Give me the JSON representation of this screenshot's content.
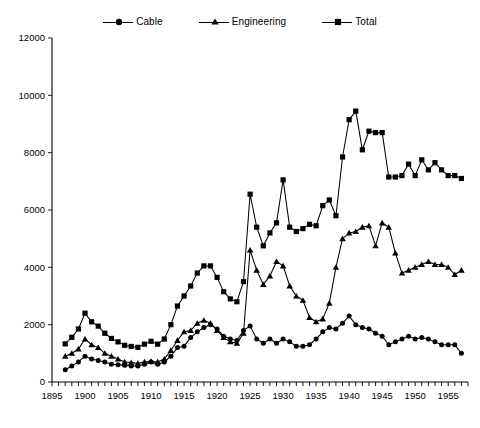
{
  "chart_data": {
    "type": "line",
    "title": "",
    "subtitle": "",
    "xlabel": "",
    "ylabel": "",
    "xlim": [
      1895,
      1958
    ],
    "ylim": [
      0,
      12000
    ],
    "ytick_step": 2000,
    "yticks": [
      0,
      2000,
      4000,
      6000,
      8000,
      10000,
      12000
    ],
    "xticks_labeled": [
      1895,
      1900,
      1905,
      1910,
      1915,
      1920,
      1925,
      1930,
      1935,
      1940,
      1945,
      1950,
      1955
    ],
    "xtick_minor_step": 1,
    "grid": false,
    "legend_position": "top-center",
    "x": [
      1897,
      1898,
      1899,
      1900,
      1901,
      1902,
      1903,
      1904,
      1905,
      1906,
      1907,
      1908,
      1909,
      1910,
      1911,
      1912,
      1913,
      1914,
      1915,
      1916,
      1917,
      1918,
      1919,
      1920,
      1921,
      1922,
      1923,
      1924,
      1925,
      1926,
      1927,
      1928,
      1929,
      1930,
      1931,
      1932,
      1933,
      1934,
      1935,
      1936,
      1937,
      1938,
      1939,
      1940,
      1941,
      1942,
      1943,
      1944,
      1945,
      1946,
      1947,
      1948,
      1949,
      1950,
      1951,
      1952,
      1953,
      1954,
      1955,
      1956,
      1957
    ],
    "series": [
      {
        "name": "Cable",
        "marker": "circle",
        "color": "#000000",
        "values": [
          430,
          560,
          700,
          900,
          800,
          750,
          700,
          620,
          600,
          580,
          560,
          560,
          620,
          700,
          620,
          700,
          900,
          1200,
          1250,
          1550,
          1750,
          1900,
          2000,
          1850,
          1600,
          1500,
          1450,
          1800,
          1950,
          1500,
          1350,
          1500,
          1350,
          1500,
          1400,
          1250,
          1250,
          1300,
          1500,
          1750,
          1900,
          1850,
          2050,
          2300,
          2000,
          1900,
          1850,
          1700,
          1600,
          1300,
          1400,
          1500,
          1600,
          1500,
          1550,
          1500,
          1400,
          1300,
          1300,
          1300,
          1000
        ]
      },
      {
        "name": "Engineering",
        "marker": "triangle",
        "color": "#000000",
        "values": [
          900,
          1000,
          1150,
          1500,
          1300,
          1200,
          1000,
          900,
          800,
          700,
          680,
          650,
          700,
          720,
          700,
          800,
          1100,
          1450,
          1750,
          1800,
          2050,
          2150,
          2050,
          1800,
          1550,
          1400,
          1350,
          1700,
          4600,
          3900,
          3400,
          3700,
          4200,
          4050,
          3350,
          3000,
          2850,
          2250,
          2100,
          2200,
          2750,
          4000,
          5000,
          5200,
          5250,
          5400,
          5450,
          4750,
          5550,
          5400,
          4500,
          3800,
          3900,
          4000,
          4100,
          4200,
          4100,
          4100,
          4000,
          3750,
          3900
        ]
      },
      {
        "name": "Total",
        "marker": "square",
        "color": "#000000",
        "values": [
          1330,
          1560,
          1850,
          2400,
          2100,
          1950,
          1700,
          1520,
          1400,
          1280,
          1240,
          1210,
          1320,
          1420,
          1320,
          1500,
          2000,
          2650,
          3000,
          3350,
          3800,
          4050,
          4050,
          3650,
          3150,
          2900,
          2800,
          3500,
          6550,
          5400,
          4750,
          5200,
          5550,
          7050,
          5400,
          5250,
          5350,
          5500,
          5450,
          6150,
          6350,
          5800,
          7850,
          9150,
          9450,
          8100,
          8750,
          8700,
          8700,
          7150,
          7150,
          7200,
          7600,
          7200,
          7750,
          7400,
          7650,
          7400,
          7200,
          7200,
          7100
        ]
      }
    ],
    "legend": [
      "Cable",
      "Engineering",
      "Total"
    ]
  },
  "legend": {
    "entries": [
      {
        "label": "Cable",
        "marker": "circle-marker"
      },
      {
        "label": "Engineering",
        "marker": "triangle-marker"
      },
      {
        "label": "Total",
        "marker": "square-marker"
      }
    ]
  },
  "colors": {
    "background": "#ffffff",
    "foreground": "#000000"
  }
}
